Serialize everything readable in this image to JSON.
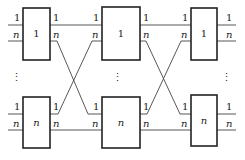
{
  "diagram": {
    "type": "network",
    "stages": [
      {
        "name": "stage-1",
        "boxes": [
          {
            "id": "s1-top",
            "label": "1",
            "inputs": [
              "1",
              "n"
            ],
            "outputs": [
              "1",
              "n"
            ]
          },
          {
            "id": "s1-bottom",
            "label": "n",
            "inputs": [
              "1",
              "n"
            ],
            "outputs": [
              "1",
              "n"
            ]
          }
        ]
      },
      {
        "name": "stage-2",
        "boxes": [
          {
            "id": "s2-top",
            "label": "1",
            "inputs": [
              "1",
              "n"
            ],
            "outputs": [
              "1",
              "n"
            ]
          },
          {
            "id": "s2-bottom",
            "label": "n",
            "inputs": [
              "1",
              "n"
            ],
            "outputs": [
              "1",
              "n"
            ]
          }
        ]
      },
      {
        "name": "stage-3",
        "boxes": [
          {
            "id": "s3-top",
            "label": "1",
            "inputs": [
              "1",
              "n"
            ],
            "outputs": [
              "1",
              "n"
            ]
          },
          {
            "id": "s3-bottom",
            "label": "n",
            "inputs": [
              "1",
              "n"
            ],
            "outputs": [
              "1",
              "n"
            ]
          }
        ]
      }
    ],
    "ellipsis": "⋮",
    "connections": [
      {
        "from": "s1-top.1",
        "to": "s2-top.1"
      },
      {
        "from": "s1-top.n",
        "to": "s2-bottom.1"
      },
      {
        "from": "s1-bottom.1",
        "to": "s2-top.n"
      },
      {
        "from": "s1-bottom.n",
        "to": "s2-bottom.n"
      },
      {
        "from": "s2-top.1",
        "to": "s3-top.1"
      },
      {
        "from": "s2-top.n",
        "to": "s3-bottom.1"
      },
      {
        "from": "s2-bottom.1",
        "to": "s3-top.n"
      },
      {
        "from": "s2-bottom.n",
        "to": "s3-bottom.n"
      }
    ]
  }
}
